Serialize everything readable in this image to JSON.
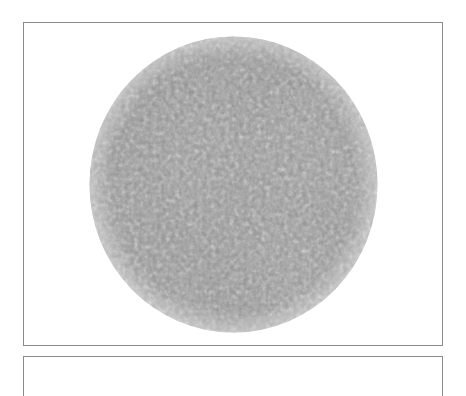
{
  "figure": {
    "panels": [
      {
        "id": "panel-top",
        "content": "circular grayscale labyrinth texture",
        "border_color": "#8a8a8a",
        "background": "#ffffff"
      },
      {
        "id": "panel-bottom",
        "content": "top edge of next panel (cut off)",
        "border_color": "#8a8a8a",
        "background": "#ffffff"
      }
    ],
    "disc": {
      "shape": "circle",
      "pattern": "labyrinthine worm-like noise",
      "base_color": "#9a9a9a",
      "dark_color": "#4a4a4a",
      "light_color": "#e6e6e6"
    }
  }
}
